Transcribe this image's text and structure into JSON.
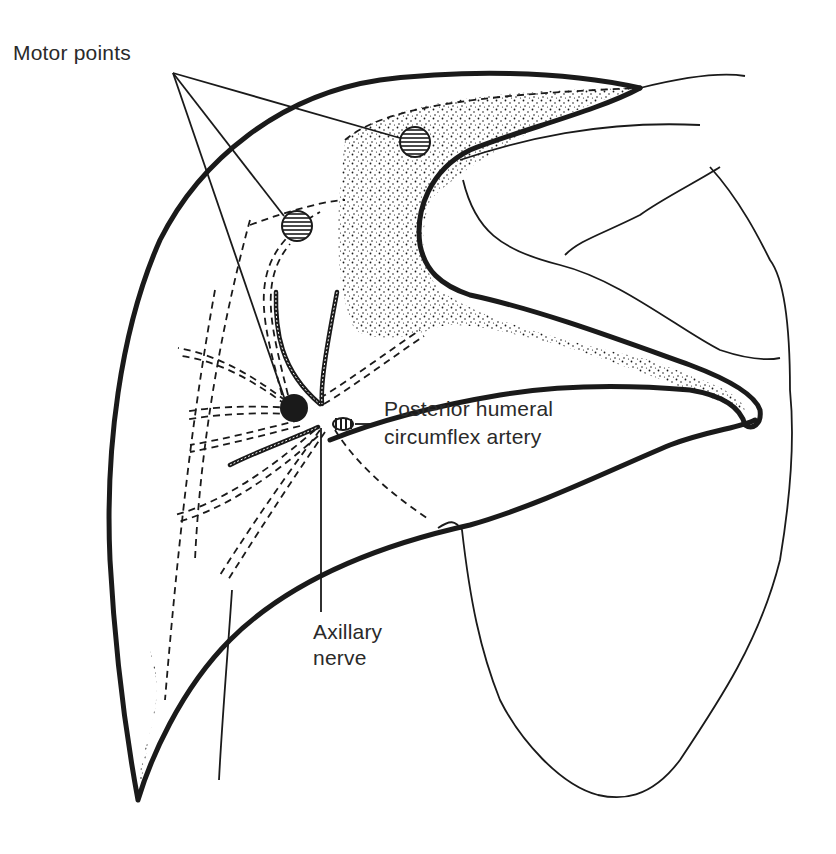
{
  "figure": {
    "type": "anatomical illustration",
    "labels": {
      "motor_points": "Motor points",
      "artery_line1": "Posterior humeral",
      "artery_line2": "circumflex artery",
      "nerve_line1": "Axillary",
      "nerve_line2": "nerve"
    },
    "colors": {
      "ink": "#1a1a1a",
      "background": "#ffffff",
      "label_text": "#2a2a2a"
    },
    "markers": {
      "motor_point_count": 2,
      "nerve_entry_point": "filled black circle"
    }
  }
}
